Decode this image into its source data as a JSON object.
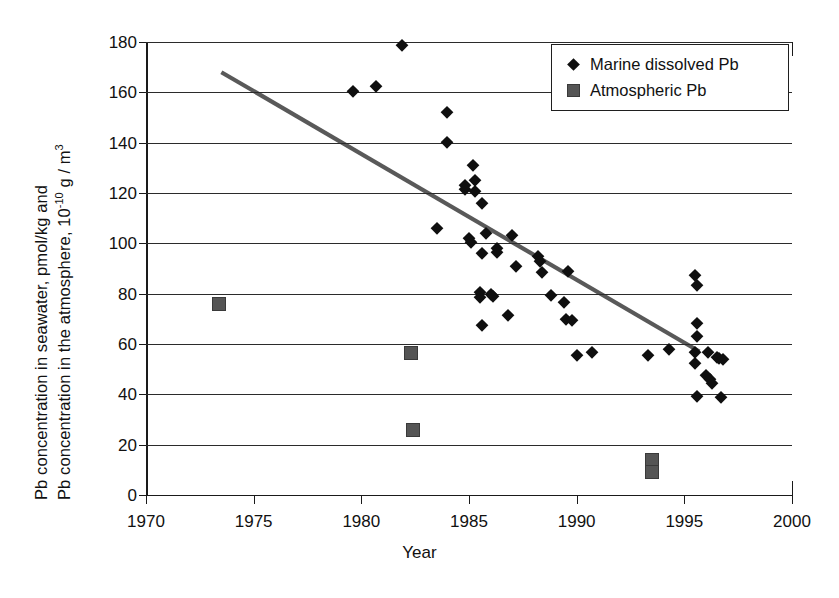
{
  "chart_data": {
    "type": "scatter",
    "title": "",
    "xlabel": "Year",
    "ylabel_line1": "Pb concentration in seawater, pmol/kg and",
    "ylabel_line2_pre": "Pb concentration in the atmosphere, 10",
    "ylabel_line2_exp": "-10",
    "ylabel_line2_post": " g / m",
    "ylabel_line2_exp2": "3",
    "xlim": [
      1970,
      2000
    ],
    "ylim": [
      0,
      180
    ],
    "xticks": [
      1970,
      1975,
      1980,
      1985,
      1990,
      1995,
      2000
    ],
    "yticks": [
      0,
      20,
      40,
      60,
      80,
      100,
      120,
      140,
      160,
      180
    ],
    "grid": "horizontal",
    "legend_position": "top-right",
    "series": [
      {
        "name": "Marine dissolved Pb",
        "marker": "diamond",
        "color": "#0f0f0f",
        "points": [
          [
            1981.9,
            179.0
          ],
          [
            1979.6,
            160.6
          ],
          [
            1980.7,
            162.6
          ],
          [
            1984.0,
            152.3
          ],
          [
            1984.0,
            140.2
          ],
          [
            1985.2,
            131.0
          ],
          [
            1985.3,
            125.0
          ],
          [
            1984.8,
            123.0
          ],
          [
            1984.8,
            121.5
          ],
          [
            1985.3,
            120.8
          ],
          [
            1985.6,
            116.0
          ],
          [
            1983.5,
            106.0
          ],
          [
            1985.0,
            102.0
          ],
          [
            1985.1,
            100.5
          ],
          [
            1985.8,
            104.0
          ],
          [
            1987.0,
            103.5
          ],
          [
            1985.6,
            96.0
          ],
          [
            1986.3,
            98.0
          ],
          [
            1986.3,
            96.5
          ],
          [
            1988.2,
            95.0
          ],
          [
            1988.3,
            93.0
          ],
          [
            1987.2,
            91.0
          ],
          [
            1988.4,
            88.5
          ],
          [
            1989.6,
            89.0
          ],
          [
            1985.5,
            80.5
          ],
          [
            1986.0,
            80.0
          ],
          [
            1986.1,
            79.0
          ],
          [
            1985.5,
            78.5
          ],
          [
            1988.8,
            79.5
          ],
          [
            1989.4,
            76.5
          ],
          [
            1986.8,
            71.5
          ],
          [
            1989.5,
            70.0
          ],
          [
            1989.8,
            69.5
          ],
          [
            1985.6,
            67.5
          ],
          [
            1995.5,
            87.5
          ],
          [
            1995.6,
            83.5
          ],
          [
            1995.6,
            68.5
          ],
          [
            1995.6,
            63.0
          ],
          [
            1994.3,
            58.0
          ],
          [
            1995.5,
            57.0
          ],
          [
            1996.1,
            57.0
          ],
          [
            1996.5,
            55.0
          ],
          [
            1996.6,
            54.5
          ],
          [
            1996.8,
            54.0
          ],
          [
            1990.7,
            57.0
          ],
          [
            1990.0,
            55.5
          ],
          [
            1993.3,
            55.5
          ],
          [
            1995.5,
            52.5
          ],
          [
            1996.0,
            47.5
          ],
          [
            1996.2,
            46.0
          ],
          [
            1996.3,
            44.5
          ],
          [
            1995.6,
            39.5
          ],
          [
            1996.7,
            39.0
          ]
        ]
      },
      {
        "name": "Atmospheric Pb",
        "marker": "square",
        "color": "#555555",
        "points": [
          [
            1973.4,
            76.0
          ],
          [
            1982.3,
            56.5
          ],
          [
            1982.4,
            26.0
          ],
          [
            1993.5,
            14.0
          ],
          [
            1993.5,
            9.0
          ]
        ]
      }
    ],
    "trendline": {
      "x0": 1973.5,
      "y0": 168.0,
      "x1": 1995.7,
      "y1": 57.0,
      "color": "#595959",
      "width": 4.2
    }
  },
  "legend": {
    "items": [
      {
        "label": "Marine dissolved Pb",
        "marker": "diamond"
      },
      {
        "label": "Atmospheric Pb",
        "marker": "square"
      }
    ]
  }
}
